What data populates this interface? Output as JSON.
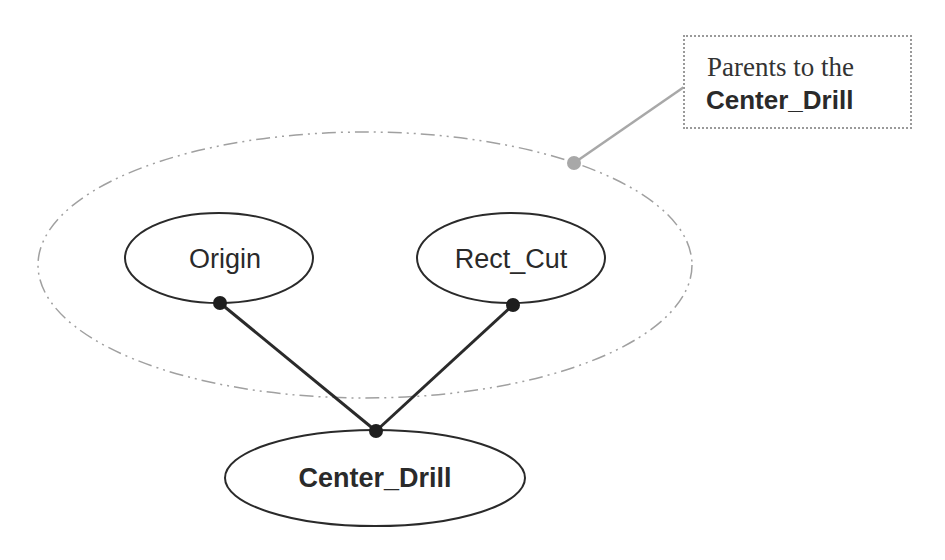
{
  "diagram": {
    "nodes": [
      {
        "id": "origin",
        "label": "Origin"
      },
      {
        "id": "rect_cut",
        "label": "Rect_Cut"
      },
      {
        "id": "center_drill",
        "label": "Center_Drill"
      }
    ],
    "edges": [
      {
        "from": "origin",
        "to": "center_drill"
      },
      {
        "from": "rect_cut",
        "to": "center_drill"
      }
    ],
    "group": {
      "label": "parents-group",
      "members": [
        "origin",
        "rect_cut"
      ]
    },
    "callout": {
      "line1": "Parents to the",
      "line2": "Center_Drill"
    },
    "colors": {
      "node_stroke": "#2a2a2a",
      "edge": "#2a2a2a",
      "group_stroke": "#9a9a9a",
      "callout_stroke": "#9a9a9a",
      "callout_dot": "#a8a8a8"
    }
  }
}
